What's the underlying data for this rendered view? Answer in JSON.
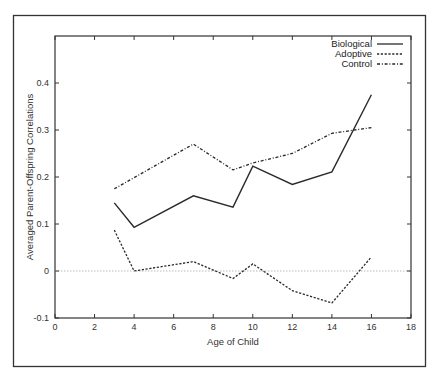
{
  "chart_data": {
    "type": "line",
    "title": "",
    "xlabel": "Age of Child",
    "ylabel": "Averaged Parent-Offspring Correlations",
    "xlim": [
      0,
      18
    ],
    "ylim": [
      -0.1,
      0.5
    ],
    "xticks": [
      0,
      2,
      4,
      6,
      8,
      10,
      12,
      14,
      16,
      18
    ],
    "yticks": [
      -0.1,
      0,
      0.1,
      0.2,
      0.3,
      0.4
    ],
    "ytick_labels": [
      "-0.1",
      "0",
      "0.1",
      "0.2",
      "0.3",
      "0.4"
    ],
    "grid": false,
    "reference_line": {
      "y": 0,
      "style": "dotted",
      "color": "#bbbbbb"
    },
    "legend_position": "top-right",
    "x": [
      3,
      4,
      7,
      9,
      10,
      12,
      14,
      16
    ],
    "series": [
      {
        "name": "Biological",
        "style": "solid",
        "values": [
          0.145,
          0.093,
          0.16,
          0.136,
          0.223,
          0.184,
          0.211,
          0.375
        ]
      },
      {
        "name": "Adoptive",
        "style": "dashed",
        "values": [
          0.087,
          0.0,
          0.02,
          -0.016,
          0.015,
          -0.042,
          -0.068,
          0.03
        ]
      },
      {
        "name": "Control",
        "style": "dash-dot",
        "values": [
          0.175,
          null,
          0.27,
          0.215,
          0.23,
          0.25,
          0.293,
          0.305
        ]
      }
    ]
  },
  "legend": {
    "items": [
      {
        "label": "Biological"
      },
      {
        "label": "Adoptive"
      },
      {
        "label": "Control"
      }
    ]
  },
  "axes": {
    "x_title": "Age of Child",
    "y_title": "Averaged Parent-Offspring Correlations"
  },
  "colors": {
    "line": "#2a2a2a",
    "frame": "#333333",
    "zero_line": "#bbbbbb"
  }
}
